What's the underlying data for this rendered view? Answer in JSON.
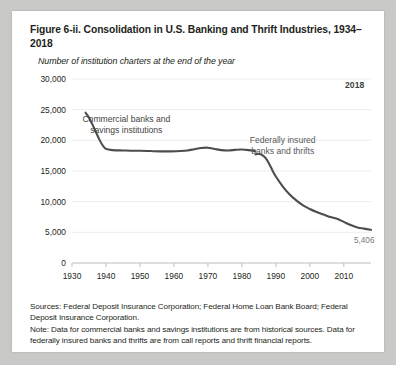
{
  "figure": {
    "title": "Figure 6-ii. Consolidation in U.S. Banking and Thrift Industries, 1934–2018",
    "subtitle": "Number of institution charters at the end of the year",
    "sources": "Sources: Federal Deposit Insurance Corporation; Federal Home Loan Bank Board; Federal Deposit Insurance Corporation.",
    "note": "Note: Data for commercial banks and savings institutions are from historical sources. Data for federally insured banks and thrifts are from call reports and thrift financial reports."
  },
  "chart_data": {
    "type": "line",
    "title": "Figure 6-ii. Consolidation in U.S. Banking and Thrift Industries, 1934–2018",
    "subtitle": "Number of institution charters at the end of the year",
    "xlabel": "",
    "ylabel": "",
    "xlim": [
      1930,
      2018
    ],
    "ylim": [
      0,
      30000
    ],
    "yticks": [
      0,
      5000,
      10000,
      15000,
      20000,
      25000,
      30000
    ],
    "ytick_labels": [
      "0",
      "5,000",
      "10,000",
      "15,000",
      "20,000",
      "25,000",
      "30,000"
    ],
    "xticks": [
      1930,
      1940,
      1950,
      1960,
      1970,
      1980,
      1990,
      2000,
      2010
    ],
    "xtick_labels": [
      "1930",
      "1940",
      "1950",
      "1960",
      "1970",
      "1980",
      "1990",
      "2000",
      "2010"
    ],
    "grid": "horizontal",
    "legend": "annotations",
    "line_color": "#4d4d4d",
    "annotations": [
      {
        "name": "commercial-banks-label",
        "text": "Commercial banks and savings institutions",
        "line1": "Commercial banks and",
        "line2": "savings institutions",
        "x": 1946,
        "y": 23000
      },
      {
        "name": "federally-insured-label",
        "text": "Federally insured banks and thrifts",
        "line1": "Federally insured",
        "line2": "banks and thrifts",
        "x": 1992,
        "y": 19500
      },
      {
        "name": "end-year-label",
        "text": "2018",
        "x": 2016,
        "y": 28600
      },
      {
        "name": "end-value-label",
        "text": "5,406",
        "x": 2016,
        "y": 3300
      }
    ],
    "series": [
      {
        "name": "Commercial banks and savings institutions",
        "x": [
          1934,
          1935,
          1936,
          1937,
          1938,
          1939,
          1940,
          1942,
          1945,
          1948,
          1950,
          1953,
          1956,
          1959,
          1962,
          1964,
          1966,
          1968,
          1970,
          1972,
          1974,
          1976,
          1978,
          1980,
          1982,
          1984
        ],
        "values": [
          24500,
          23700,
          22600,
          21400,
          20200,
          19200,
          18600,
          18400,
          18350,
          18300,
          18300,
          18250,
          18200,
          18200,
          18250,
          18350,
          18550,
          18750,
          18800,
          18600,
          18400,
          18350,
          18450,
          18500,
          18400,
          18200
        ]
      },
      {
        "name": "Federally insured banks and thrifts",
        "x": [
          1984,
          1985,
          1986,
          1987,
          1988,
          1989,
          1990,
          1992,
          1994,
          1996,
          1998,
          2000,
          2002,
          2004,
          2006,
          2008,
          2010,
          2012,
          2014,
          2016,
          2018
        ],
        "values": [
          17700,
          17800,
          17600,
          17100,
          16200,
          15100,
          14100,
          12500,
          11200,
          10200,
          9400,
          8800,
          8300,
          7900,
          7500,
          7200,
          6700,
          6200,
          5800,
          5600,
          5406
        ]
      }
    ],
    "end_value": 5406,
    "end_value_label": "5,406",
    "end_year_label": "2018"
  }
}
